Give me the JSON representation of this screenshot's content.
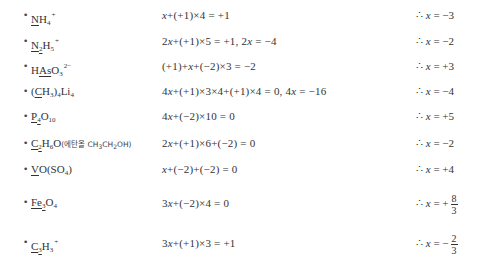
{
  "rows": [
    {
      "formula_parts": [
        {
          "t": "N",
          "u": true
        },
        {
          "t": "H"
        },
        {
          "sub": "4"
        },
        {
          "sup": "+"
        }
      ],
      "equation": "x+(+1)×4 = +1",
      "result_prefix": "∴ x = ",
      "result": "−3"
    },
    {
      "formula_parts": [
        {
          "t": "N",
          "u": true
        },
        {
          "sub": "2",
          "u": true
        },
        {
          "t": "H"
        },
        {
          "sub": "5"
        },
        {
          "sup": "+"
        }
      ],
      "equation": "2x+(+1)×5 = +1,  2x = −4",
      "result_prefix": "∴ x = ",
      "result": "−2"
    },
    {
      "formula_parts": [
        {
          "t": "H"
        },
        {
          "t": "As",
          "u": true
        },
        {
          "t": "O"
        },
        {
          "sub": "3"
        },
        {
          "sup": "2−"
        }
      ],
      "equation": "(+1)+x+(−2)×3 = −2",
      "result_prefix": "∴ x = ",
      "result": "+3"
    },
    {
      "formula_parts": [
        {
          "t": "("
        },
        {
          "t": "C",
          "u": true
        },
        {
          "t": "H"
        },
        {
          "sub": "3"
        },
        {
          "t": ")"
        },
        {
          "sub": "4"
        },
        {
          "t": "Li"
        },
        {
          "sub": "4"
        }
      ],
      "equation": "4x+(+1)×3×4+(+1)×4 = 0,  4x = −16",
      "result_prefix": "∴ x = ",
      "result": "−4"
    },
    {
      "formula_parts": [
        {
          "t": "P",
          "u": true
        },
        {
          "sub": "4",
          "u": true
        },
        {
          "t": "O"
        },
        {
          "sub": "10"
        }
      ],
      "equation": "4x+(−2)×10 = 0",
      "result_prefix": "∴ x = ",
      "result": "+5"
    },
    {
      "formula_parts": [
        {
          "t": "C",
          "u": true
        },
        {
          "sub": "2",
          "u": true
        },
        {
          "t": "H"
        },
        {
          "sub": "6"
        },
        {
          "t": "O"
        },
        {
          "note": "(에탄올 CH"
        },
        {
          "notesub": "3"
        },
        {
          "note": "CH"
        },
        {
          "notesub": "2"
        },
        {
          "note": "OH)"
        }
      ],
      "equation": "2x+(+1)×6+(−2) = 0",
      "result_prefix": "∴ x = ",
      "result": "−2"
    },
    {
      "formula_parts": [
        {
          "t": "V",
          "u": true
        },
        {
          "t": "O(SO"
        },
        {
          "sub": "4"
        },
        {
          "t": ")"
        }
      ],
      "equation": "x+(−2)+(−2) = 0",
      "result_prefix": "∴ x = ",
      "result": "+4"
    },
    {
      "formula_parts": [
        {
          "t": "Fe",
          "u": true
        },
        {
          "sub": "3",
          "u": true
        },
        {
          "t": "O"
        },
        {
          "sub": "4"
        }
      ],
      "equation": "3x+(−2)×4 = 0",
      "result_prefix": "∴ x = ",
      "result_sign": "+",
      "result_num": "8",
      "result_den": "3"
    },
    {
      "formula_parts": [
        {
          "t": "C",
          "u": true
        },
        {
          "sub": "3",
          "u": true
        },
        {
          "t": "H"
        },
        {
          "sub": "3"
        },
        {
          "sup": "+"
        }
      ],
      "equation": "3x+(+1)×3 = +1",
      "result_prefix": "∴ x = ",
      "result_sign": "−",
      "result_num": "2",
      "result_den": "3"
    }
  ],
  "row_tops": [
    3,
    29,
    54,
    79,
    104,
    131,
    157,
    189,
    229
  ],
  "bullet": "•"
}
